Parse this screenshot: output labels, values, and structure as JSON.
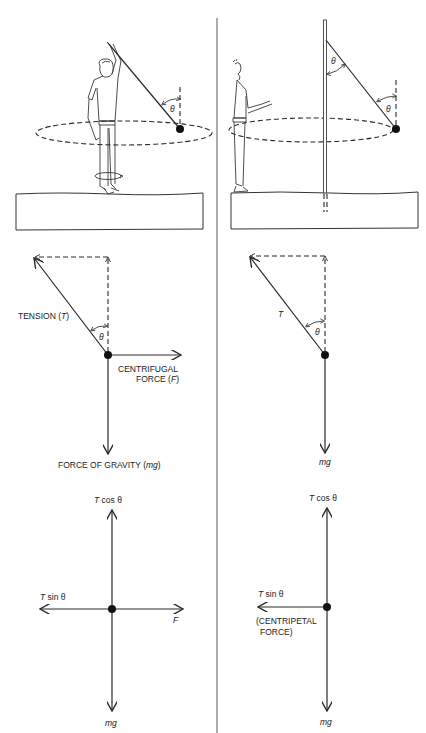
{
  "diagram": {
    "columns": [
      {
        "id": "rotating-frame",
        "scene": {
          "description": "Person swinging a ball on a string overhead while rotating",
          "angle_label": "θ"
        },
        "force_diagram": {
          "tension_label": "TENSION (",
          "tension_symbol": "T",
          "tension_close": ")",
          "angle_label": "θ",
          "centrifugal_line1": "CENTRIFUGAL",
          "centrifugal_line2": "FORCE (",
          "centrifugal_symbol": "F",
          "centrifugal_close": ")",
          "gravity_label": "FORCE OF GRAVITY (",
          "gravity_symbol": "mg",
          "gravity_close": ")"
        },
        "components": {
          "up_T": "T",
          "up_rest": " cos θ",
          "left_T": "T",
          "left_rest": " sin θ",
          "right": "F",
          "down": "mg"
        }
      },
      {
        "id": "inertial-frame",
        "scene": {
          "description": "Observer watching a ball on a string tied to a pole circling",
          "angle_label_top": "θ",
          "angle_label_bottom": "θ"
        },
        "force_diagram": {
          "tension_symbol": "T",
          "angle_label": "θ",
          "gravity_symbol": "mg"
        },
        "components": {
          "up_T": "T",
          "up_rest": " cos θ",
          "left_T": "T",
          "left_rest": " sin θ",
          "left_note_line1": "(CENTRIPETAL",
          "left_note_line2": "FORCE)",
          "down": "mg"
        }
      }
    ]
  }
}
